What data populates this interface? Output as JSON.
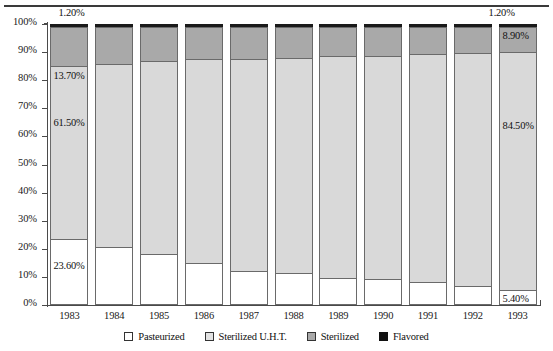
{
  "chart_data": {
    "type": "bar",
    "subtype": "stacked-100-percent",
    "title": "",
    "xlabel": "",
    "ylabel": "",
    "ylim": [
      0,
      100
    ],
    "grid": false,
    "legend_position": "bottom-center",
    "categories": [
      "1983",
      "1984",
      "1985",
      "1986",
      "1987",
      "1988",
      "1989",
      "1990",
      "1991",
      "1992",
      "1993"
    ],
    "ytick_labels": [
      "0%",
      "10%",
      "20%",
      "30%",
      "40%",
      "50%",
      "60%",
      "70%",
      "80%",
      "90%",
      "100%"
    ],
    "ytick_values": [
      0,
      10,
      20,
      30,
      40,
      50,
      60,
      70,
      80,
      90,
      100
    ],
    "series": [
      {
        "name": "Pasteurized",
        "color": "#ffffff",
        "values": [
          23.6,
          20.8,
          18.0,
          15.0,
          12.1,
          11.4,
          9.7,
          9.2,
          8.1,
          6.8,
          5.4
        ]
      },
      {
        "name": "Sterilized U.H.T.",
        "color": "#d9d9d9",
        "values": [
          61.5,
          65.0,
          68.7,
          72.5,
          75.5,
          76.6,
          79.0,
          79.5,
          81.3,
          82.8,
          84.5
        ]
      },
      {
        "name": "Sterilized",
        "color": "#a9a9a9",
        "values": [
          13.7,
          13.0,
          12.1,
          11.3,
          11.2,
          10.8,
          10.1,
          10.1,
          9.4,
          9.2,
          8.9
        ]
      },
      {
        "name": "Flavored",
        "color": "#1a1a1a",
        "values": [
          1.2,
          1.2,
          1.2,
          1.2,
          1.2,
          1.2,
          1.2,
          1.2,
          1.2,
          1.2,
          1.2
        ]
      }
    ],
    "annotations": [
      {
        "text": "1.20%",
        "year": "1983",
        "series": "Flavored"
      },
      {
        "text": "13.70%",
        "year": "1983",
        "series": "Sterilized"
      },
      {
        "text": "61.50%",
        "year": "1983",
        "series": "Sterilized U.H.T."
      },
      {
        "text": "23.60%",
        "year": "1983",
        "series": "Pasteurized"
      },
      {
        "text": "1.20%",
        "year": "1993",
        "series": "Flavored"
      },
      {
        "text": "8.90%",
        "year": "1993",
        "series": "Sterilized"
      },
      {
        "text": "84.50%",
        "year": "1993",
        "series": "Sterilized U.H.T."
      },
      {
        "text": "5.40%",
        "year": "1993",
        "series": "Pasteurized"
      }
    ]
  },
  "legend": {
    "items": [
      {
        "label": "Pasteurized",
        "swatch": "pasteurized-swatch"
      },
      {
        "label": "Sterilized U.H.T.",
        "swatch": "uht-swatch"
      },
      {
        "label": "Sterilized",
        "swatch": "sterilized-swatch"
      },
      {
        "label": "Flavored",
        "swatch": "flavored-swatch"
      }
    ]
  },
  "annotation_text": {
    "left_flavored": "1.20%",
    "left_sterilized": "13.70%",
    "left_uht": "61.50%",
    "left_pasteurized": "23.60%",
    "right_flavored": "1.20%",
    "right_sterilized": "8.90%",
    "right_uht": "84.50%",
    "right_pasteurized": "5.40%"
  }
}
